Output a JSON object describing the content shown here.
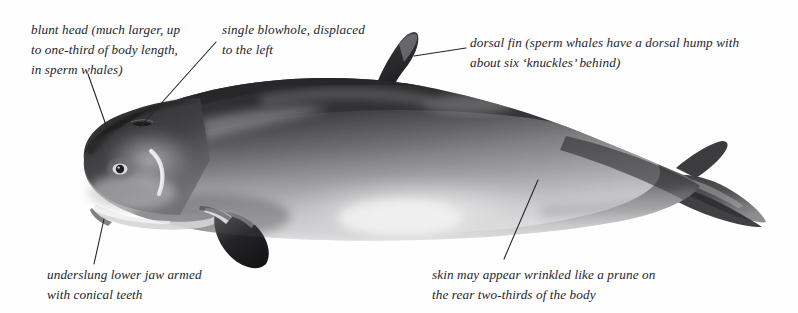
{
  "figure": {
    "orientation": "left-facing lateral view",
    "style": "grayscale stipple illustration",
    "background_color": "#ffffff",
    "ink_color": "#25262b"
  },
  "labels": {
    "head": {
      "name": "blunt-head-label",
      "line1": "blunt head (much larger, up",
      "line2": "to one-third of body length,",
      "line3": "in sperm whales)"
    },
    "blowhole": {
      "name": "blowhole-label",
      "line1": "single blowhole, displaced",
      "line2": "to the left"
    },
    "dorsal": {
      "name": "dorsal-fin-label",
      "line1": "dorsal fin (sperm whales have a dorsal hump with",
      "line2": "about six ‘knuckles’ behind)"
    },
    "jaw": {
      "name": "lower-jaw-label",
      "line1": "underslung lower jaw armed",
      "line2": "with conical teeth"
    },
    "skin": {
      "name": "skin-texture-label",
      "line1": "skin may appear wrinkled like a prune on",
      "line2": "the rear two-thirds of the body"
    }
  },
  "leaders": [
    {
      "name": "leader-head",
      "x1": 88,
      "y1": 74,
      "x2": 107,
      "y2": 128
    },
    {
      "name": "leader-blowhole",
      "x1": 216,
      "y1": 42,
      "x2": 140,
      "y2": 127
    },
    {
      "name": "leader-dorsal",
      "x1": 466,
      "y1": 48,
      "x2": 414,
      "y2": 56
    },
    {
      "name": "leader-jaw",
      "x1": 104,
      "y1": 219,
      "x2": 94,
      "y2": 264
    },
    {
      "name": "leader-skin",
      "x1": 538,
      "y1": 180,
      "x2": 504,
      "y2": 259
    }
  ],
  "anatomy": {
    "head": "blunt-head",
    "eye": "eye",
    "blowhole": "blowhole",
    "false_gill": "false-gill-bracket-mark",
    "flipper": "pectoral-flipper",
    "dorsal_fin": "dorsal-fin",
    "flukes": "tail-flukes",
    "belly": "pale-belly-patch"
  }
}
